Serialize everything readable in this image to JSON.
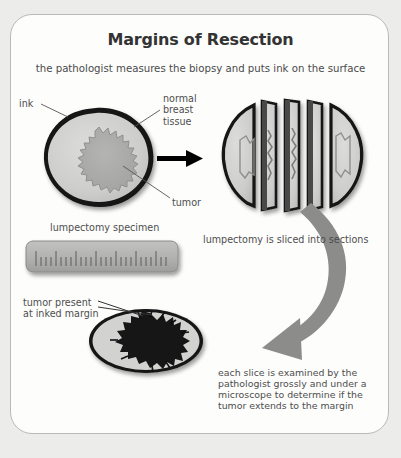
{
  "figure": {
    "title": "Margins of Resection",
    "subtitle": "the pathologist measures the biopsy and puts ink on the surface"
  },
  "labels": {
    "ink": "ink",
    "normal_breast_tissue": "normal\nbreast\ntissue",
    "tumor": "tumor",
    "lumpectomy_specimen": "lumpectomy specimen",
    "sliced_caption": "lumpectomy is sliced into sections",
    "tumor_present_margin": "tumor present\nat inked margin",
    "examination_note": "each slice is examined by the\npathologist grossly and under a\nmicroscope to determine if the\ntumor extends to the margin"
  },
  "colors": {
    "page_background": "#ececeb",
    "card_background": "#fdfdfc",
    "card_border": "#b9b9b6",
    "title_text": "#333333",
    "body_text": "#4d4d4d",
    "ink_margin": "#111111",
    "normal_tissue": "#cfcfcd",
    "tumor_gray": "#a9a9a7",
    "tumor_black": "#121212",
    "ruler_body": "#b2b2b0",
    "curved_arrow": "#8c8c8a",
    "black_arrow": "#000000",
    "leader_line": "#555555"
  },
  "graphics": {
    "specimen_whole": "round lumpectomy specimen with black inked rim, light gray normal tissue and a spiky gray tumor at center",
    "specimen_sliced": "same specimen cut into five vertical slices separated by gaps showing dark cut faces",
    "ruler": "gray ruler with tick marks representing measurement of the specimen",
    "specimen_margin": "oval slice with black spiky tumor extending to the inked margin",
    "arrow_black": "black straight arrow pointing right",
    "arrow_curved": "thick gray curved arrow sweeping down and to the left"
  }
}
